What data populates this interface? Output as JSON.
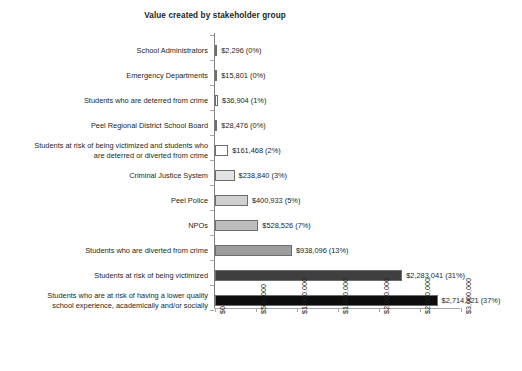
{
  "chart_data": {
    "type": "bar",
    "orientation": "horizontal",
    "title": "Value created by stakeholder group",
    "xlabel": "",
    "ylabel": "",
    "xlim": [
      0,
      3000000
    ],
    "grid": false,
    "legend": null,
    "xticks": [
      "$0",
      "$500,000",
      "$1,000,000",
      "$1,500,000",
      "$2,000,000",
      "$2,500,000",
      "$3,000,000"
    ],
    "xtick_values": [
      0,
      500000,
      1000000,
      1500000,
      2000000,
      2500000,
      3000000
    ],
    "categories": [
      "School Administrators",
      "Emergency Departments",
      "Students who are deterred from crime",
      "Peel Regional District School Board",
      "Students at risk of being victimized and students who\nare deterred or diverted from crime",
      "Criminal Justice System",
      "Peel Police",
      "NPOs",
      "Students who are diverted from crime",
      "Students at risk of being victimized",
      "Students who are at risk of having a lower quality\nschool experience, academically and/or socially"
    ],
    "values": [
      2296,
      15801,
      36904,
      28476,
      161468,
      238840,
      400933,
      528526,
      938096,
      2283041,
      2714921
    ],
    "percents": [
      "0%",
      "0%",
      "1%",
      "0%",
      "2%",
      "3%",
      "5%",
      "7%",
      "13%",
      "31%",
      "37%"
    ],
    "labels": [
      "$2,296 (0%)",
      "$15,801 (0%)",
      "$36,904 (1%)",
      "$28,476 (0%)",
      "$161,468 (2%)",
      "$238,840 (3%)",
      "$400,933 (5%)",
      "$528,526 (7%)",
      "$938,096 (13%)",
      "$2,283,041 (31%)",
      "$2,714,921 (37%)"
    ],
    "bar_colors": [
      "#ffffff",
      "#fbfbfb",
      "#ffffff",
      "#f2f2f2",
      "#ffffff",
      "#e3e3e3",
      "#cfcfcf",
      "#bdbdbd",
      "#9d9d9d",
      "#3f3f3f",
      "#0d0d0d"
    ],
    "bar_border_color": "#6d6d6d",
    "axis_color": "#a6a6a6",
    "text_color": "#231f20"
  }
}
